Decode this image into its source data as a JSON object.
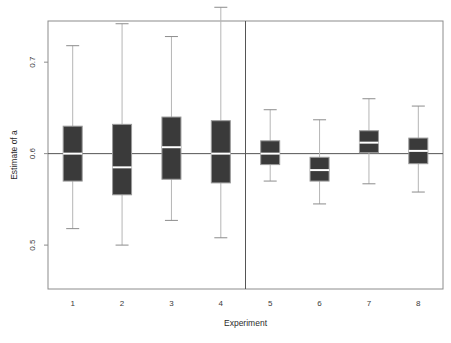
{
  "chart_data": {
    "type": "boxplot",
    "title": "",
    "xlabel": "Experiment",
    "ylabel": "Estimate of a",
    "ylim": [
      0.452,
      0.745
    ],
    "xlim": [
      0.5,
      8.5
    ],
    "yticks": [
      0.5,
      0.6,
      0.7
    ],
    "ytick_labels": [
      "0.5",
      "0.6",
      "0.7"
    ],
    "xticks": [
      1,
      2,
      3,
      4,
      5,
      6,
      7,
      8
    ],
    "xtick_labels": [
      "1",
      "2",
      "3",
      "4",
      "5",
      "6",
      "7",
      "8"
    ],
    "grid": false,
    "legend": null,
    "reference_line": {
      "orientation": "horizontal",
      "value": 0.6,
      "color": "#555555"
    },
    "panel_divider": {
      "orientation": "vertical",
      "value": 4.5,
      "color": "#555555"
    },
    "categories": [
      "1",
      "2",
      "3",
      "4",
      "5",
      "6",
      "7",
      "8"
    ],
    "boxes": [
      {
        "category": "1",
        "whisker_low": 0.518,
        "q1": 0.57,
        "median": 0.6,
        "q3": 0.63,
        "whisker_high": 0.718
      },
      {
        "category": "2",
        "whisker_low": 0.5,
        "q1": 0.555,
        "median": 0.585,
        "q3": 0.632,
        "whisker_high": 0.742
      },
      {
        "category": "3",
        "whisker_low": 0.527,
        "q1": 0.572,
        "median": 0.607,
        "q3": 0.64,
        "whisker_high": 0.728
      },
      {
        "category": "4",
        "whisker_low": 0.508,
        "q1": 0.568,
        "median": 0.6,
        "q3": 0.636,
        "whisker_high": 0.76
      },
      {
        "category": "5",
        "whisker_low": 0.57,
        "q1": 0.588,
        "median": 0.6,
        "q3": 0.614,
        "whisker_high": 0.648
      },
      {
        "category": "6",
        "whisker_low": 0.545,
        "q1": 0.57,
        "median": 0.582,
        "q3": 0.596,
        "whisker_high": 0.637
      },
      {
        "category": "7",
        "whisker_low": 0.567,
        "q1": 0.601,
        "median": 0.612,
        "q3": 0.625,
        "whisker_high": 0.66
      },
      {
        "category": "8",
        "whisker_low": 0.558,
        "q1": 0.589,
        "median": 0.603,
        "q3": 0.617,
        "whisker_high": 0.652
      }
    ],
    "style": {
      "box_fill": "#3a3a3a",
      "box_edge": "#9a9a9a",
      "median_color": "#ffffff",
      "whisker_color": "#b5b5b5",
      "cap_color": "#8c8c8c",
      "frame_color": "#8c8c8c",
      "background": "#ffffff"
    }
  }
}
